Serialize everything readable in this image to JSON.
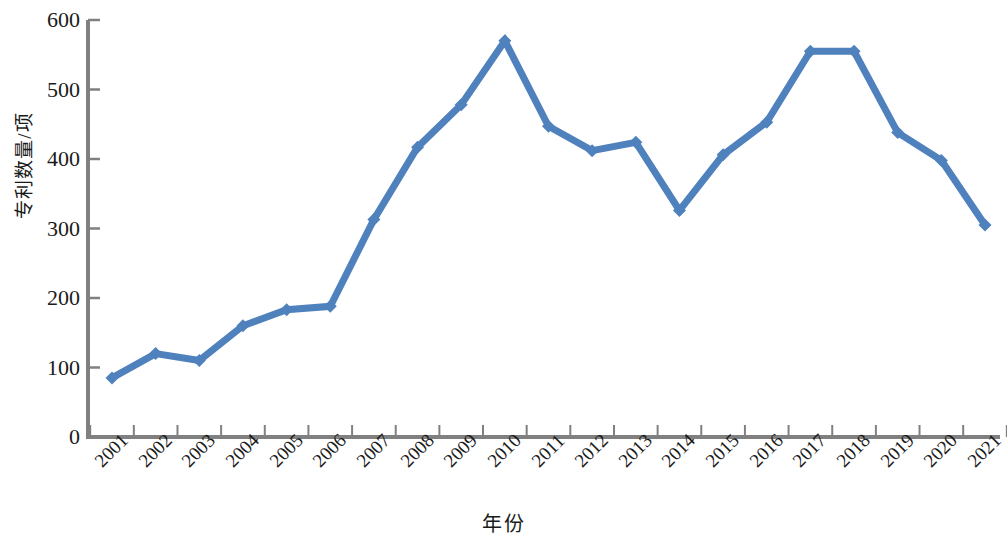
{
  "chart_data": {
    "type": "line",
    "title": "",
    "xlabel": "年份",
    "ylabel": "专利数量/项",
    "categories": [
      "2001",
      "2002",
      "2003",
      "2004",
      "2005",
      "2006",
      "2007",
      "2008",
      "2009",
      "2010",
      "2011",
      "2012",
      "2013",
      "2014",
      "2015",
      "2016",
      "2017",
      "2018",
      "2019",
      "2020",
      "2021"
    ],
    "values": [
      85,
      120,
      110,
      160,
      183,
      188,
      313,
      417,
      478,
      570,
      447,
      412,
      424,
      326,
      406,
      453,
      555,
      555,
      438,
      398,
      305
    ],
    "series": [
      {
        "name": "专利数量",
        "values": [
          85,
          120,
          110,
          160,
          183,
          188,
          313,
          417,
          478,
          570,
          447,
          412,
          424,
          326,
          406,
          453,
          555,
          555,
          438,
          398,
          305
        ]
      }
    ],
    "y_ticks": [
      0,
      100,
      200,
      300,
      400,
      500,
      600
    ],
    "y_tick_labels": [
      "0",
      "100",
      "200",
      "300",
      "400",
      "500",
      "600"
    ],
    "ylim": [
      0,
      600
    ],
    "grid": false,
    "legend": "none",
    "marker": "diamond",
    "colors": {
      "line": "#4f81bd",
      "marker": "#4f81bd",
      "axis": "#808080",
      "text": "#1a1a1a",
      "background": "#ffffff"
    }
  }
}
